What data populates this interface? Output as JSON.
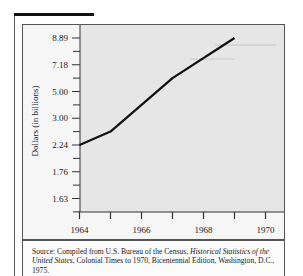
{
  "chart_data": {
    "type": "line",
    "title": "",
    "xlabel": "",
    "ylabel": "Dollars (in billions)",
    "x_ticks": [
      "1964",
      "1966",
      "1968",
      "1970"
    ],
    "x_minor_ticks": [
      1964,
      1965,
      1966,
      1967,
      1968,
      1969,
      1970
    ],
    "y_ticks": [
      "8.89",
      "7.18",
      "5.00",
      "3.00",
      "2.24",
      "1.76",
      "1.63"
    ],
    "y_axis_note": "non-linear (equally spaced labels)",
    "xlim": [
      1964,
      1970.6
    ],
    "grid": false,
    "legend": null,
    "series": [
      {
        "name": "Dollars (in billions)",
        "x": [
          1964,
          1965,
          1967,
          1969
        ],
        "values": [
          2.24,
          2.62,
          6.09,
          8.89
        ]
      }
    ]
  },
  "chart": {
    "ylabel": "Dollars (in billions)",
    "y_tick_labels": [
      "8.89",
      "7.18",
      "5.00",
      "3.00",
      "2.24",
      "1.76",
      "1.63"
    ],
    "x_tick_labels": [
      "1964",
      "1966",
      "1968",
      "1970"
    ]
  },
  "source": {
    "prefix": "Source: Compiled from U.S. Bureau of the Census, ",
    "title_italic": "Historical Statistics of the United States",
    "suffix": ", Colonial Times to 1970, Bicentennial Edition, Washington, D.C., 1975."
  },
  "colors": {
    "line": "#111111",
    "plot_background": "#e6e6e6",
    "border": "#555555"
  }
}
